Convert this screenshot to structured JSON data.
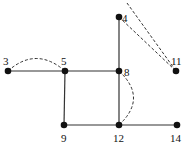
{
  "diagram": {
    "type": "graph",
    "nodes": [
      {
        "id": "3",
        "label": "3",
        "x": 8,
        "y": 71,
        "lx": 3,
        "ly": 65
      },
      {
        "id": "5",
        "label": "5",
        "x": 65,
        "y": 71,
        "lx": 61,
        "ly": 65
      },
      {
        "id": "8",
        "label": "8",
        "x": 119,
        "y": 71,
        "lx": 124,
        "ly": 76
      },
      {
        "id": "4",
        "label": "4",
        "x": 119,
        "y": 17,
        "lx": 122,
        "ly": 22
      },
      {
        "id": "11",
        "label": "11",
        "x": 176,
        "y": 71,
        "lx": 171,
        "ly": 65
      },
      {
        "id": "9",
        "label": "9",
        "x": 64,
        "y": 125,
        "lx": 61,
        "ly": 142
      },
      {
        "id": "12",
        "label": "12",
        "x": 119,
        "y": 125,
        "lx": 113,
        "ly": 142
      },
      {
        "id": "14",
        "label": "14",
        "x": 177,
        "y": 125,
        "lx": 170,
        "ly": 142
      }
    ],
    "solid_edges": [
      {
        "from": "3",
        "to": "5"
      },
      {
        "from": "5",
        "to": "8"
      },
      {
        "from": "5",
        "to": "9"
      },
      {
        "from": "9",
        "to": "12"
      },
      {
        "from": "4",
        "to": "8"
      },
      {
        "from": "8",
        "to": "12"
      },
      {
        "from": "12",
        "to": "14"
      }
    ],
    "dashed_edges": [
      {
        "from": "3",
        "to": "5",
        "style": "arc-up"
      },
      {
        "from": "8",
        "to": "12",
        "style": "arc-right"
      },
      {
        "from": "4",
        "to": "11",
        "style": "straight"
      },
      {
        "from": "top",
        "to": "11",
        "style": "straight-from-top"
      }
    ],
    "colors": {
      "line": "#333333",
      "node": "#111111",
      "background": "#ffffff"
    }
  }
}
